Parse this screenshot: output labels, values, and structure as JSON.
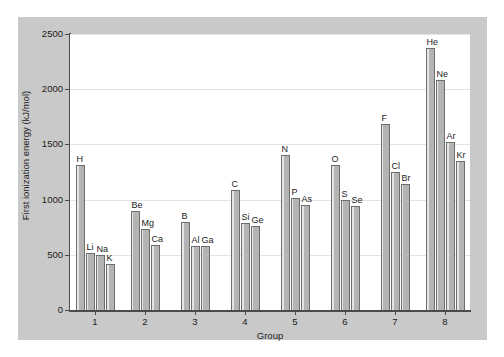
{
  "chart_data": {
    "type": "bar",
    "title": "",
    "xlabel": "Group",
    "ylabel": "First ionization energy (kJ/mol)",
    "ylim": [
      0,
      2500
    ],
    "yticks": [
      0,
      500,
      1000,
      1500,
      2000,
      2500
    ],
    "xticks": [
      "1",
      "2",
      "3",
      "4",
      "5",
      "6",
      "7",
      "8"
    ],
    "grid": true,
    "legend": "none",
    "categories": [
      "1",
      "2",
      "3",
      "4",
      "5",
      "6",
      "7",
      "8"
    ],
    "groups": [
      {
        "group": "1",
        "bars": [
          {
            "label": "H",
            "value": 1312
          },
          {
            "label": "Li",
            "value": 520
          },
          {
            "label": "Na",
            "value": 496
          },
          {
            "label": "K",
            "value": 419
          }
        ]
      },
      {
        "group": "2",
        "bars": [
          {
            "label": "Be",
            "value": 900
          },
          {
            "label": "Mg",
            "value": 738
          },
          {
            "label": "Ca",
            "value": 590
          }
        ]
      },
      {
        "group": "3",
        "bars": [
          {
            "label": "B",
            "value": 801
          },
          {
            "label": "Al",
            "value": 578
          },
          {
            "label": "Ga",
            "value": 579
          }
        ]
      },
      {
        "group": "4",
        "bars": [
          {
            "label": "C",
            "value": 1086
          },
          {
            "label": "Si",
            "value": 786
          },
          {
            "label": "Ge",
            "value": 762
          }
        ]
      },
      {
        "group": "5",
        "bars": [
          {
            "label": "N",
            "value": 1402
          },
          {
            "label": "P",
            "value": 1012
          },
          {
            "label": "As",
            "value": 947
          }
        ]
      },
      {
        "group": "6",
        "bars": [
          {
            "label": "O",
            "value": 1314
          },
          {
            "label": "S",
            "value": 1000
          },
          {
            "label": "Se",
            "value": 941
          }
        ]
      },
      {
        "group": "7",
        "bars": [
          {
            "label": "F",
            "value": 1681
          },
          {
            "label": "Cl",
            "value": 1251
          },
          {
            "label": "Br",
            "value": 1140
          }
        ]
      },
      {
        "group": "8",
        "bars": [
          {
            "label": "He",
            "value": 2372
          },
          {
            "label": "Ne",
            "value": 2081
          },
          {
            "label": "Ar",
            "value": 1521
          },
          {
            "label": "Kr",
            "value": 1351
          }
        ]
      }
    ]
  },
  "colors": {
    "panel_background": "#c9c9c9",
    "plot_background": "#ffffff",
    "bar_fill": "#b4b4b4",
    "bar_edge": "#6e6e6e",
    "axis": "#4b4b4b",
    "gridline": "#e3e3e3",
    "text": "#1c1c1c"
  }
}
